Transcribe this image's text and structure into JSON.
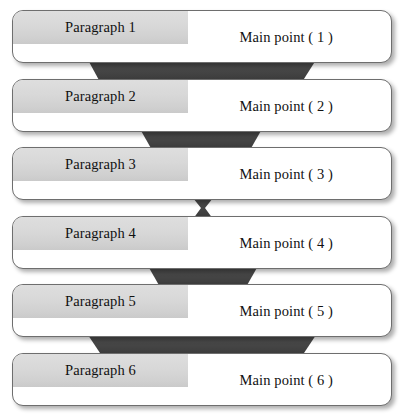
{
  "diagram": {
    "type": "vertical-flow",
    "colors": {
      "box_fill": "#ffffff",
      "box_border": "#6e6e6e",
      "band_fill": "#d8d8d8",
      "connector_fill": "#424242",
      "text": "#111111",
      "background": "#ffffff"
    },
    "rows": [
      {
        "paragraph": "Paragraph 1",
        "main_point": "Main point ( 1 )",
        "top": 10
      },
      {
        "paragraph": "Paragraph 2",
        "main_point": "Main point ( 2 )",
        "top": 79
      },
      {
        "paragraph": "Paragraph 3",
        "main_point": "Main point ( 3 )",
        "top": 147
      },
      {
        "paragraph": "Paragraph 4",
        "main_point": "Main point ( 4 )",
        "top": 216
      },
      {
        "paragraph": "Paragraph 5",
        "main_point": "Main point ( 5 )",
        "top": 284
      },
      {
        "paragraph": "Paragraph 6",
        "main_point": "Main point ( 6 )",
        "top": 353
      }
    ],
    "connectors": [
      {
        "name": "connector-1-2",
        "shape": "trapezoid",
        "top_left": 88,
        "top_right": 316,
        "bottom_left": 100,
        "bottom_right": 302,
        "y_top": 61,
        "y_bottom": 81
      },
      {
        "name": "connector-2-3",
        "shape": "trapezoid",
        "top_left": 140,
        "top_right": 262,
        "bottom_left": 152,
        "bottom_right": 250,
        "y_top": 130,
        "y_bottom": 149
      },
      {
        "name": "connector-3-4",
        "shape": "bowtie",
        "top_left": 194,
        "top_right": 212,
        "bottom_left": 194,
        "bottom_right": 212,
        "y_top": 199,
        "y_bottom": 218
      },
      {
        "name": "connector-4-5",
        "shape": "trapezoid",
        "top_left": 148,
        "top_right": 256,
        "bottom_left": 160,
        "bottom_right": 244,
        "y_top": 267,
        "y_bottom": 286
      },
      {
        "name": "connector-5-6",
        "shape": "trapezoid",
        "top_left": 88,
        "top_right": 316,
        "bottom_left": 102,
        "bottom_right": 302,
        "y_top": 336,
        "y_bottom": 355
      }
    ]
  }
}
